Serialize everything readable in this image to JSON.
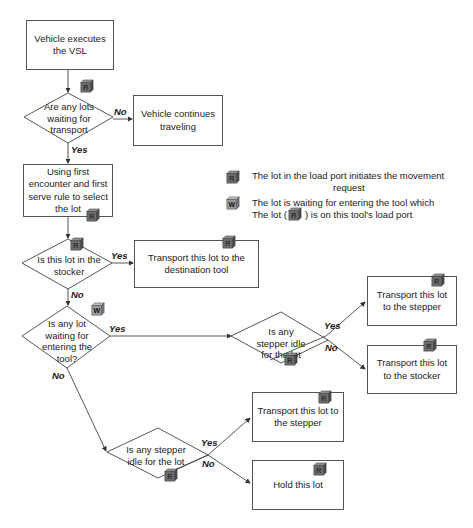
{
  "nodes": {
    "start": "Vehicle executes the VSL",
    "q_waiting": "Are any lots waiting for transport",
    "continue": "Vehicle continues traveling",
    "select": "Using first encounter and first serve rule to select the lot",
    "q_stocker": "Is this lot in the stocker",
    "to_dest": "Transport this lot to the destination tool",
    "q_entering": "Is any lot waiting for entering the tool?",
    "q_stepper1": "Is any stepper idle for the lot",
    "to_stepper1": "Transport this lot to the stepper",
    "to_stocker": "Transport this lot to the stocker",
    "q_stepper2": "Is any stepper idle for the lot",
    "to_stepper2": "Transport this lot to the stepper",
    "hold": "Hold this lot"
  },
  "edges": {
    "yes": "Yes",
    "no": "No"
  },
  "legend": {
    "r_text_1": "The lot in the load port initiates the movement",
    "r_text_2": "request",
    "w_text_1": "The lot is waiting for entering the tool which",
    "w_text_2a": "The lot (",
    "w_text_2b": ") is on this tool's load port"
  },
  "icons": {
    "r": "R",
    "w": "W"
  },
  "colors": {
    "line": "#444444",
    "cube_r_front": "#6b6b6b",
    "cube_r_top": "#8d8d8d",
    "cube_r_side": "#4a4a4a",
    "cube_w_front": "#9a9a9a"
  }
}
